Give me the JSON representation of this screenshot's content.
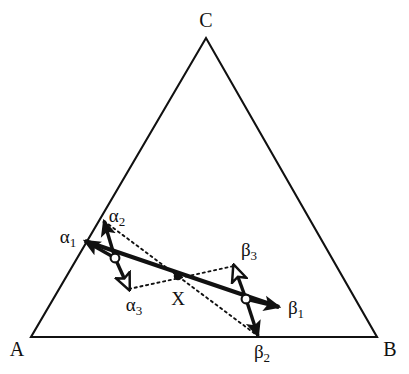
{
  "figure": {
    "type": "ternary-diagram",
    "background_color": "#ffffff",
    "stroke_color": "#111111",
    "canvas": {
      "width": 409,
      "height": 374
    }
  },
  "triangle": {
    "vertices": [
      {
        "name": "A",
        "label": "A",
        "x": 31,
        "y": 337
      },
      {
        "name": "B",
        "label": "B",
        "x": 377,
        "y": 337
      },
      {
        "name": "C",
        "label": "C",
        "x": 206,
        "y": 38
      }
    ],
    "vertex_labels": [
      {
        "label": "A",
        "x": 17,
        "y": 349
      },
      {
        "label": "B",
        "x": 390,
        "y": 349
      },
      {
        "label": "C",
        "x": 206,
        "y": 20
      }
    ]
  },
  "points": [
    {
      "name": "alpha-node",
      "style": "open-circle",
      "x": 115,
      "y": 258
    },
    {
      "name": "x-point",
      "label": "X",
      "style": "filled-dot",
      "x": 178,
      "y": 276
    },
    {
      "name": "beta-node",
      "style": "open-circle",
      "x": 246,
      "y": 299
    }
  ],
  "point_labels": [
    {
      "label": "X",
      "x": 178,
      "y": 298
    }
  ],
  "vectors": [
    {
      "name": "alpha-1",
      "label": "α",
      "subscript": "1",
      "from_x": 115,
      "from_y": 258,
      "to_x": 85,
      "to_y": 241,
      "arrowhead": "filled",
      "label_x": 68,
      "label_y": 238
    },
    {
      "name": "alpha-2",
      "label": "α",
      "subscript": "2",
      "from_x": 115,
      "from_y": 258,
      "to_x": 104,
      "to_y": 221,
      "arrowhead": "filled",
      "label_x": 117,
      "label_y": 217
    },
    {
      "name": "alpha-3",
      "label": "α",
      "subscript": "3",
      "from_x": 115,
      "from_y": 258,
      "to_x": 129,
      "to_y": 289,
      "arrowhead": "hollow",
      "label_x": 134,
      "label_y": 306
    },
    {
      "name": "beta-1",
      "label": "β",
      "subscript": "1",
      "from_x": 246,
      "from_y": 299,
      "to_x": 279,
      "to_y": 307,
      "arrowhead": "filled",
      "label_x": 296,
      "label_y": 309
    },
    {
      "name": "beta-2",
      "label": "β",
      "subscript": "2",
      "from_x": 246,
      "from_y": 299,
      "to_x": 258,
      "to_y": 336,
      "arrowhead": "filled",
      "label_x": 262,
      "label_y": 353
    },
    {
      "name": "beta-3",
      "label": "β",
      "subscript": "3",
      "from_x": 246,
      "from_y": 299,
      "to_x": 234,
      "to_y": 266,
      "arrowhead": "hollow",
      "label_x": 249,
      "label_y": 251
    }
  ],
  "solid_tie_line": {
    "name": "main-tie-line",
    "from_x": 85,
    "from_y": 241,
    "to_x": 279,
    "to_y": 307,
    "stroke_width": 4
  },
  "dotted_lines": [
    {
      "name": "dotted-alpha2-to-beta2",
      "from_x": 104,
      "from_y": 221,
      "to_x": 258,
      "to_y": 336
    },
    {
      "name": "dotted-alpha3-to-beta3",
      "from_x": 129,
      "from_y": 289,
      "to_x": 234,
      "to_y": 266
    }
  ]
}
